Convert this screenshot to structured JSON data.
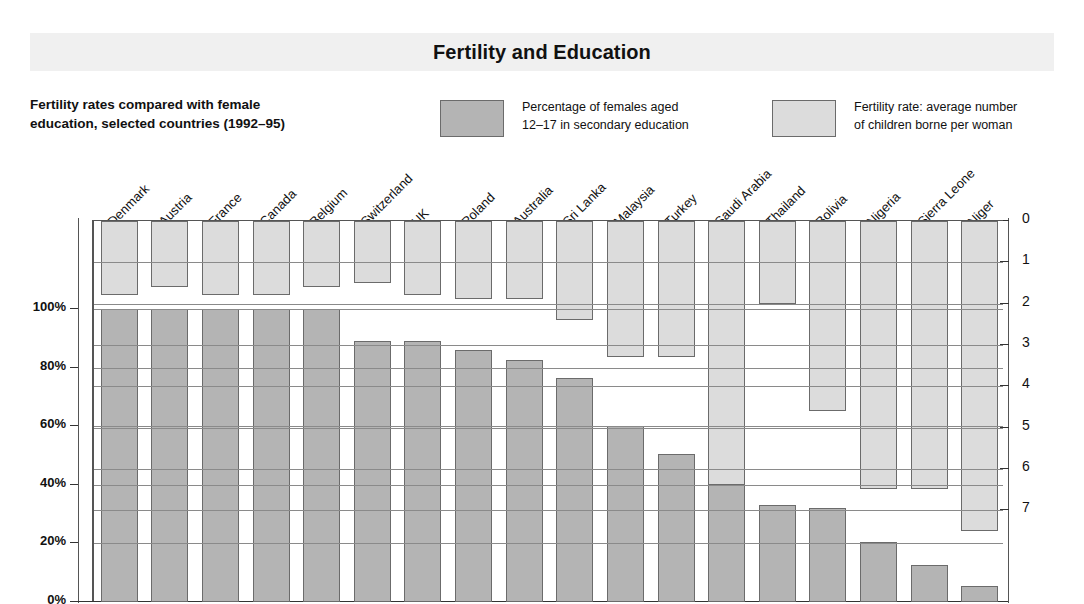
{
  "title": "Fertility and Education",
  "subtitle": "Fertility rates compared with female education, selected countries (1992–95)",
  "subtitle_line1": "Fertility rates compared with female",
  "subtitle_line2": "education, selected countries (1992–95)",
  "legend": {
    "education": {
      "line1": "Percentage of females aged",
      "line2": "12–17 in secondary education",
      "color": "#b4b4b4"
    },
    "fertility": {
      "line1": "Fertility rate: average number",
      "line2": "of children borne per woman",
      "color": "#dcdcdc"
    }
  },
  "axes": {
    "left_ticks": [
      "0%",
      "20%",
      "40%",
      "60%",
      "80%",
      "100%"
    ],
    "left_values": [
      0,
      20,
      40,
      60,
      80,
      100
    ],
    "right_ticks": [
      "0",
      "1",
      "2",
      "3",
      "4",
      "5",
      "6",
      "7"
    ],
    "right_values": [
      0,
      1,
      2,
      3,
      4,
      5,
      6,
      7
    ]
  },
  "chart_data": {
    "type": "bar",
    "title": "Fertility and Education",
    "subtitle": "Fertility rates compared with female education, selected countries (1992–95)",
    "xlabel": "",
    "ylabel": "Percentage of females aged 12–17 in secondary education",
    "ylabel_right": "Fertility rate: average number of children borne per woman",
    "ylim": [
      0,
      100
    ],
    "ylim_right": [
      0,
      7.7
    ],
    "right_axis_inverted": true,
    "grid": true,
    "legend_position": "top",
    "categories": [
      "Denmark",
      "Austria",
      "France",
      "Canada",
      "Belgium",
      "Switzerland",
      "UK",
      "Poland",
      "Australia",
      "Sri Lanka",
      "Malaysia",
      "Turkey",
      "Saudi Arabia",
      "Thailand",
      "Bolivia",
      "Nigeria",
      "Sierra Leone",
      "Niger"
    ],
    "series": [
      {
        "name": "Percentage of females aged 12–17 in secondary education",
        "unit": "%",
        "color": "#b4b4b4",
        "values": [
          100,
          100,
          100,
          100,
          100,
          89,
          89,
          86,
          82.5,
          76.5,
          60,
          50.5,
          40,
          33,
          32,
          20.5,
          12.5,
          5.5
        ]
      },
      {
        "name": "Fertility rate: average number of children borne per woman",
        "unit": "children per woman",
        "color": "#dcdcdc",
        "values": [
          1.8,
          1.6,
          1.8,
          1.8,
          1.6,
          1.5,
          1.8,
          1.9,
          1.9,
          2.4,
          3.3,
          3.3,
          6.4,
          2.0,
          4.6,
          6.5,
          6.5,
          7.5
        ]
      }
    ]
  }
}
